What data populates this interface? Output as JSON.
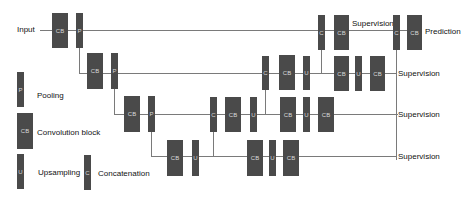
{
  "input_label": "Input",
  "output_label": "Prediction",
  "supervision_label": "Supervision",
  "blocks": {
    "cb": "CB",
    "p": "P",
    "u": "U",
    "c": "C"
  },
  "legend": {
    "pooling": {
      "symbol": "P",
      "label": "Pooling"
    },
    "conv": {
      "symbol": "CB",
      "label": "Convolution block"
    },
    "upsampling": {
      "symbol": "U",
      "label": "Upsampling"
    },
    "concat": {
      "symbol": "C",
      "label": "Concatenation"
    }
  },
  "colors": {
    "block": "#4a4a4a",
    "line": "#7a7a7a"
  }
}
